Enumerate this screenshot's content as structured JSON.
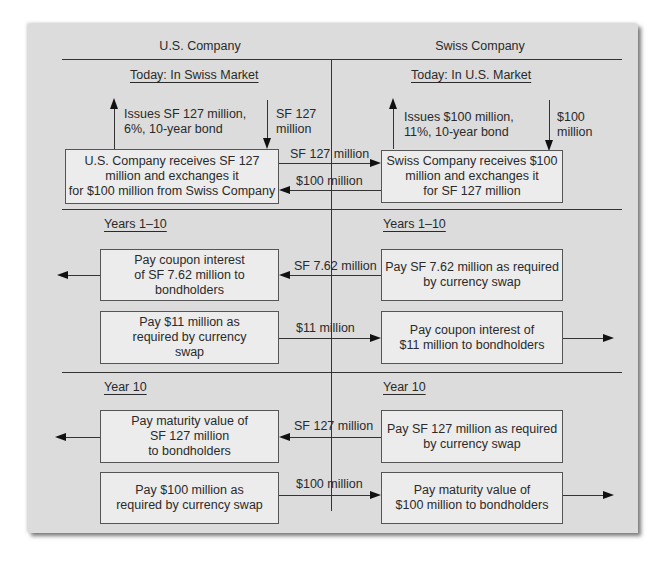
{
  "columns": {
    "left": "U.S. Company",
    "right": "Swiss Company"
  },
  "today": {
    "left_heading": "Today: In Swiss Market",
    "right_heading": "Today: In U.S. Market",
    "left_issue": "Issues SF 127 million,\n6%, 10-year bond",
    "left_inflow": "SF 127\nmillion",
    "right_issue": "Issues $100 million,\n11%, 10-year bond",
    "right_inflow": "$100\nmillion",
    "left_box": "U.S. Company receives SF 127\nmillion and exchanges it\nfor $100 million from Swiss Company",
    "right_box": "Swiss Company receives $100\nmillion and exchanges it\nfor SF 127 million",
    "flow_to_right": "SF 127 million",
    "flow_to_left": "$100 million"
  },
  "years": {
    "left_heading": "Years 1–10",
    "right_heading": "Years 1–10",
    "left_box1": "Pay coupon interest\nof SF 7.62 million to\nbondholders",
    "right_box1": "Pay SF 7.62 million as required\nby currency swap",
    "flow1": "SF 7.62 million",
    "left_box2": "Pay $11 million as\nrequired by currency\nswap",
    "right_box2": "Pay coupon interest of\n$11 million to bondholders",
    "flow2": "$11 million"
  },
  "final": {
    "left_heading": "Year 10",
    "right_heading": "Year 10",
    "left_box1": "Pay maturity value of\nSF 127 million\nto bondholders",
    "right_box1": "Pay SF 127 million as required\nby currency swap",
    "flow1": "SF 127 million",
    "left_box2": "Pay $100 million as\nrequired by currency swap",
    "right_box2": "Pay maturity value of\n$100 million to bondholders",
    "flow2": "$100 million"
  }
}
